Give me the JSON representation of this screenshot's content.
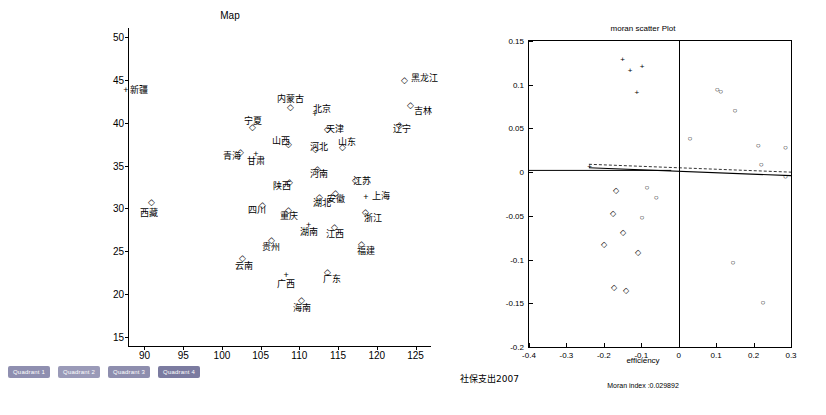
{
  "map": {
    "title": "Map",
    "xticks": [
      90,
      95,
      100,
      105,
      110,
      115,
      120,
      125
    ],
    "yticks": [
      15,
      20,
      25,
      30,
      35,
      40,
      45,
      50
    ],
    "xlim": [
      88,
      127
    ],
    "ylim": [
      14,
      51
    ],
    "points": [
      {
        "label": "新疆",
        "x": 87.6,
        "y": 43.8,
        "marker": "+",
        "lx": 89.3,
        "ly": 43.8
      },
      {
        "label": "黑龙江",
        "x": 123.6,
        "y": 45.0,
        "marker": "◇",
        "lx": 126.2,
        "ly": 45.2
      },
      {
        "label": "吉林",
        "x": 124.3,
        "y": 42.0,
        "marker": "◇",
        "lx": 126.0,
        "ly": 41.3
      },
      {
        "label": "内蒙古",
        "x": 108.9,
        "y": 41.8,
        "marker": "◇",
        "lx": 108.9,
        "ly": 42.7
      },
      {
        "label": "北京",
        "x": 112.0,
        "y": 41.0,
        "marker": "+",
        "lx": 112.9,
        "ly": 41.6
      },
      {
        "label": "辽宁",
        "x": 122.9,
        "y": 39.7,
        "marker": "◇",
        "lx": 123.2,
        "ly": 39.2
      },
      {
        "label": "天津",
        "x": 113.6,
        "y": 39.2,
        "marker": "◇",
        "lx": 114.6,
        "ly": 39.3
      },
      {
        "label": "宁夏",
        "x": 104.0,
        "y": 39.5,
        "marker": "◇",
        "lx": 104.0,
        "ly": 40.2
      },
      {
        "label": "山西",
        "x": 108.6,
        "y": 37.5,
        "marker": "◇",
        "lx": 107.6,
        "ly": 37.9
      },
      {
        "label": "山东",
        "x": 115.6,
        "y": 37.2,
        "marker": "◇",
        "lx": 116.2,
        "ly": 37.7
      },
      {
        "label": "河北",
        "x": 112.1,
        "y": 36.9,
        "marker": "◇",
        "lx": 112.6,
        "ly": 37.2
      },
      {
        "label": "青海",
        "x": 102.4,
        "y": 36.6,
        "marker": "◇",
        "lx": 101.3,
        "ly": 36.1
      },
      {
        "label": "甘肃",
        "x": 104.4,
        "y": 36.3,
        "marker": "+",
        "lx": 104.4,
        "ly": 35.5
      },
      {
        "label": "河南",
        "x": 112.3,
        "y": 34.6,
        "marker": "◇",
        "lx": 112.6,
        "ly": 34.0
      },
      {
        "label": "江苏",
        "x": 117.3,
        "y": 33.3,
        "marker": "◇",
        "lx": 118.1,
        "ly": 33.2
      },
      {
        "label": "陕西",
        "x": 108.7,
        "y": 33.1,
        "marker": "◇",
        "lx": 107.8,
        "ly": 32.6
      },
      {
        "label": "安徽",
        "x": 114.7,
        "y": 31.8,
        "marker": "◇",
        "lx": 114.7,
        "ly": 31.1
      },
      {
        "label": "上海",
        "x": 118.6,
        "y": 31.3,
        "marker": "+",
        "lx": 120.5,
        "ly": 31.4
      },
      {
        "label": "湖北",
        "x": 112.6,
        "y": 31.3,
        "marker": "◇",
        "lx": 112.9,
        "ly": 30.6
      },
      {
        "label": "西藏",
        "x": 90.9,
        "y": 30.8,
        "marker": "◇",
        "lx": 90.6,
        "ly": 29.5
      },
      {
        "label": "四川",
        "x": 105.2,
        "y": 30.4,
        "marker": "◇",
        "lx": 104.5,
        "ly": 29.8
      },
      {
        "label": "重庆",
        "x": 108.6,
        "y": 29.8,
        "marker": "◇",
        "lx": 108.6,
        "ly": 29.1
      },
      {
        "label": "浙江",
        "x": 118.6,
        "y": 29.6,
        "marker": "◇",
        "lx": 119.5,
        "ly": 28.9
      },
      {
        "label": "湖南",
        "x": 111.2,
        "y": 28.1,
        "marker": "+",
        "lx": 111.2,
        "ly": 27.3
      },
      {
        "label": "江西",
        "x": 114.6,
        "y": 27.8,
        "marker": "◇",
        "lx": 114.6,
        "ly": 27.0
      },
      {
        "label": "贵州",
        "x": 106.4,
        "y": 26.3,
        "marker": "◇",
        "lx": 106.4,
        "ly": 25.5
      },
      {
        "label": "福建",
        "x": 118.0,
        "y": 25.9,
        "marker": "◇",
        "lx": 118.6,
        "ly": 25.0
      },
      {
        "label": "云南",
        "x": 102.7,
        "y": 24.2,
        "marker": "◇",
        "lx": 102.9,
        "ly": 23.3
      },
      {
        "label": "广西",
        "x": 108.3,
        "y": 22.3,
        "marker": "+",
        "lx": 108.3,
        "ly": 21.2
      },
      {
        "label": "广东",
        "x": 113.6,
        "y": 22.6,
        "marker": "◇",
        "lx": 114.2,
        "ly": 21.8
      },
      {
        "label": "海南",
        "x": 110.3,
        "y": 19.3,
        "marker": "◇",
        "lx": 110.3,
        "ly": 18.4
      }
    ]
  },
  "legend": [
    {
      "label": "Quadrant 1",
      "color": "#8f8fb0"
    },
    {
      "label": "Quadrant 2",
      "color": "#9a9ab8"
    },
    {
      "label": "Quadrant 3",
      "color": "#8e8eae"
    },
    {
      "label": "Quadrant 4",
      "color": "#7b7ba0"
    }
  ],
  "bottom_note": "社保支出2007",
  "moran": {
    "title": "moran scatter Plot",
    "xlabel": "efficiency",
    "index_label": "Moran index :0.029892",
    "xticks": [
      -0.4,
      -0.3,
      -0.2,
      -0.1,
      0,
      0.1,
      0.2,
      0.3
    ],
    "yticks": [
      -0.2,
      -0.15,
      -0.1,
      -0.05,
      0,
      0.05,
      0.1,
      0.15
    ],
    "xlim": [
      -0.4,
      0.3
    ],
    "ylim": [
      -0.2,
      0.15
    ],
    "vline_x": 0,
    "hline_y": 0,
    "fit_line": {
      "x1": -0.24,
      "y1": 0.005,
      "x2": 0.3,
      "y2": -0.004
    },
    "points": [
      {
        "x": -0.15,
        "y": 0.128,
        "marker": "+"
      },
      {
        "x": -0.13,
        "y": 0.116,
        "marker": "+"
      },
      {
        "x": -0.098,
        "y": 0.12,
        "marker": "+"
      },
      {
        "x": -0.112,
        "y": 0.09,
        "marker": "+"
      },
      {
        "x": 0.103,
        "y": 0.094,
        "marker": "○"
      },
      {
        "x": 0.112,
        "y": 0.092,
        "marker": "○"
      },
      {
        "x": 0.15,
        "y": 0.07,
        "marker": "○"
      },
      {
        "x": 0.03,
        "y": 0.038,
        "marker": "○"
      },
      {
        "x": 0.212,
        "y": 0.03,
        "marker": "○"
      },
      {
        "x": 0.285,
        "y": 0.028,
        "marker": "○"
      },
      {
        "x": 0.22,
        "y": 0.008,
        "marker": "○"
      },
      {
        "x": -0.238,
        "y": 0.006,
        "marker": "+"
      },
      {
        "x": 0.285,
        "y": -0.005,
        "marker": "○"
      },
      {
        "x": -0.168,
        "y": -0.022,
        "marker": "◇"
      },
      {
        "x": -0.085,
        "y": -0.018,
        "marker": "○"
      },
      {
        "x": -0.06,
        "y": -0.03,
        "marker": "○"
      },
      {
        "x": -0.175,
        "y": -0.048,
        "marker": "◇"
      },
      {
        "x": -0.098,
        "y": -0.052,
        "marker": "○"
      },
      {
        "x": -0.15,
        "y": -0.07,
        "marker": "◇"
      },
      {
        "x": -0.2,
        "y": -0.083,
        "marker": "◇"
      },
      {
        "x": -0.11,
        "y": -0.092,
        "marker": "◇"
      },
      {
        "x": 0.145,
        "y": -0.104,
        "marker": "○"
      },
      {
        "x": -0.172,
        "y": -0.133,
        "marker": "◇"
      },
      {
        "x": -0.14,
        "y": -0.136,
        "marker": "◇"
      },
      {
        "x": 0.225,
        "y": -0.15,
        "marker": "○"
      }
    ]
  }
}
